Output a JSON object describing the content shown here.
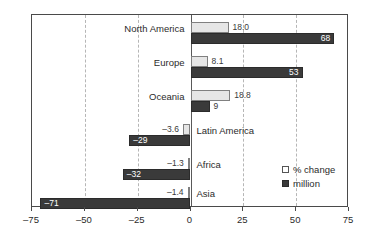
{
  "chart_data": {
    "type": "bar",
    "title": "",
    "subtitle": "",
    "xlabel": "",
    "ylabel": "",
    "orientation": "horizontal",
    "grid": true,
    "legend_position": "bottom-right",
    "xlim": [
      -75,
      75
    ],
    "xticks": [
      -75,
      -50,
      -25,
      0,
      25,
      50,
      75
    ],
    "xtick_labels": [
      "–75",
      "–50",
      "–25",
      "0",
      "25",
      "50",
      "75"
    ],
    "categories": [
      "North America",
      "Europe",
      "Oceania",
      "Latin America",
      "Africa",
      "Asia"
    ],
    "series": [
      {
        "name": "% change",
        "values": [
          18.0,
          8.1,
          18.8,
          -3.6,
          -1.3,
          -1.4
        ],
        "labels": [
          "18.0",
          "8.1",
          "18.8",
          "–3.6",
          "–1.3",
          "–1.4"
        ],
        "color": "#e6e6e6"
      },
      {
        "name": "million",
        "values": [
          68,
          53,
          9,
          -29,
          -32,
          -71
        ],
        "labels": [
          "68",
          "53",
          "9",
          "–29",
          "–32",
          "–71"
        ],
        "color": "#3a3a3a"
      }
    ]
  },
  "legend": {
    "items": [
      {
        "label": "% change",
        "swatch": "light-square-swatch"
      },
      {
        "label": "million",
        "swatch": "dark-square-swatch"
      }
    ]
  }
}
